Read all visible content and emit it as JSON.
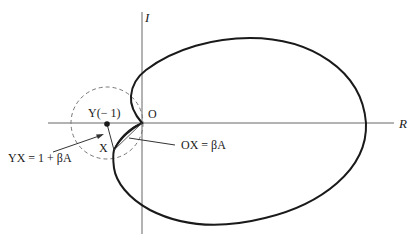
{
  "diagram": {
    "axes": {
      "imaginary_label": "I",
      "real_label": "R"
    },
    "points": {
      "origin_label": "O",
      "critical_point_label": "Y(− 1)",
      "point_x_label": "X"
    },
    "annotations": {
      "yx_label": "YX = 1 + βA",
      "ox_label": "OX = βA"
    },
    "colors": {
      "curve": "#1a1a1a",
      "axis": "#555555",
      "dashed_circle": "#777777"
    }
  }
}
